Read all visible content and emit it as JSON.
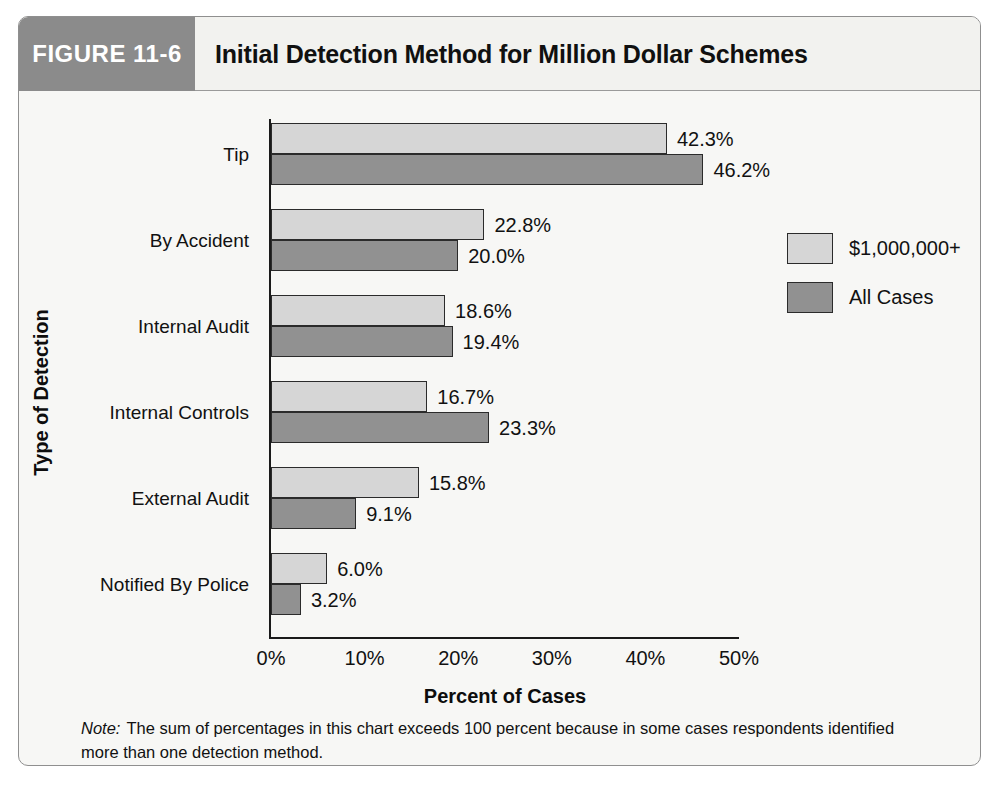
{
  "figure": {
    "number_label": "FIGURE 11-6",
    "title": "Initial Detection Method for Million Dollar Schemes"
  },
  "footnote": {
    "label": "Note:",
    "text": "The sum of percentages in this chart exceeds 100 percent because in some cases respondents identified more than one detection method."
  },
  "colors": {
    "header_block": "#8b8b8b",
    "series_1000000_plus": "#d6d6d6",
    "series_all_cases": "#919191",
    "frame_border": "#8f8f8f",
    "background": "#f7f7f5"
  },
  "chart_data": {
    "type": "bar",
    "orientation": "horizontal",
    "title": "Initial Detection Method for Million Dollar Schemes",
    "xlabel": "Percent of Cases",
    "ylabel": "Type of Detection",
    "xlim": [
      0,
      50
    ],
    "xticks": [
      0,
      10,
      20,
      30,
      40,
      50
    ],
    "xtick_labels": [
      "0%",
      "10%",
      "20%",
      "30%",
      "40%",
      "50%"
    ],
    "grid": false,
    "legend_position": "right",
    "categories": [
      "Tip",
      "By Accident",
      "Internal Audit",
      "Internal Controls",
      "External Audit",
      "Notified By Police"
    ],
    "series": [
      {
        "name": "$1,000,000+",
        "color": "#d6d6d6",
        "values": [
          42.3,
          22.8,
          18.6,
          16.7,
          15.8,
          6.0
        ],
        "labels": [
          "42.3%",
          "22.8%",
          "18.6%",
          "16.7%",
          "15.8%",
          "6.0%"
        ]
      },
      {
        "name": "All Cases",
        "color": "#919191",
        "values": [
          46.2,
          20.0,
          19.4,
          23.3,
          9.1,
          3.2
        ],
        "labels": [
          "46.2%",
          "20.0%",
          "19.4%",
          "23.3%",
          "9.1%",
          "3.2%"
        ]
      }
    ]
  }
}
